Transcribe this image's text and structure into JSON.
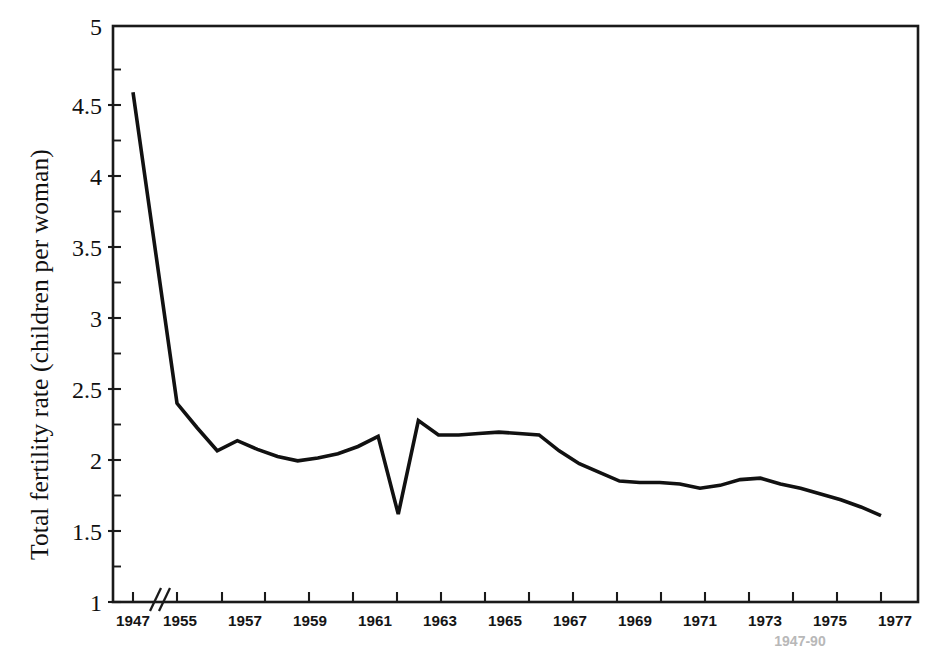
{
  "figure": {
    "name": "total-fertility-rate-line-chart",
    "background_color": "#ffffff",
    "line_color": "#111111",
    "axis_color": "#1a1a1a"
  },
  "axes": {
    "y_label": "Total fertility rate (children per woman)",
    "y_ticks": [
      "1",
      "1.5",
      "2",
      "2.5",
      "3",
      "3.5",
      "4",
      "4.5",
      "5"
    ],
    "y_min": 1,
    "y_max": 5,
    "y_major_step": 0.5,
    "y_minor_step": 0.25,
    "x_ticks": [
      "1947",
      "1955",
      "1957",
      "1959",
      "1961",
      "1963",
      "1965",
      "1967",
      "1969",
      "1971",
      "1973",
      "1975",
      "1977",
      "1979",
      "1981",
      "1983",
      "1985",
      "1987",
      "1989"
    ],
    "x_axis_break": "//",
    "x_axis_break_note": "axis break between 1947 and 1955"
  },
  "caption": {
    "partial_text": "1947-90"
  },
  "chart_data": {
    "type": "line",
    "title": "",
    "xlabel": "",
    "ylabel": "Total fertility rate (children per woman)",
    "ylim": [
      1,
      5
    ],
    "grid": false,
    "legend": false,
    "axis_break": {
      "between": [
        1947,
        1955
      ],
      "marker": "//"
    },
    "x": [
      1947,
      1955,
      1956,
      1957,
      1958,
      1959,
      1960,
      1961,
      1962,
      1963,
      1964,
      1965,
      1966,
      1967,
      1968,
      1969,
      1970,
      1971,
      1972,
      1973,
      1974,
      1975,
      1976,
      1977,
      1978,
      1979,
      1980,
      1981,
      1982,
      1983,
      1984,
      1985,
      1986,
      1987,
      1988,
      1989,
      1990
    ],
    "tick_labels_shown": [
      "1947",
      "1955",
      "1957",
      "1959",
      "1961",
      "1963",
      "1965",
      "1967",
      "1969",
      "1971",
      "1973",
      "1975",
      "1977",
      "1979",
      "1981",
      "1983",
      "1985",
      "1987",
      "1989"
    ],
    "values": [
      4.54,
      2.38,
      2.21,
      2.05,
      2.12,
      2.06,
      2.01,
      1.98,
      2.0,
      2.03,
      2.08,
      2.15,
      1.61,
      2.26,
      2.16,
      2.16,
      2.17,
      2.18,
      2.17,
      2.16,
      2.05,
      1.96,
      1.9,
      1.84,
      1.83,
      1.83,
      1.82,
      1.79,
      1.81,
      1.85,
      1.86,
      1.82,
      1.79,
      1.75,
      1.71,
      1.66,
      1.6
    ],
    "series": [
      {
        "name": "Total fertility rate",
        "values": [
          4.54,
          2.38,
          2.21,
          2.05,
          2.12,
          2.06,
          2.01,
          1.98,
          2.0,
          2.03,
          2.08,
          2.15,
          1.61,
          2.26,
          2.16,
          2.16,
          2.17,
          2.18,
          2.17,
          2.16,
          2.05,
          1.96,
          1.9,
          1.84,
          1.83,
          1.83,
          1.82,
          1.79,
          1.81,
          1.85,
          1.86,
          1.82,
          1.79,
          1.75,
          1.71,
          1.66,
          1.6
        ]
      }
    ],
    "annotations": [
      {
        "x": 1966,
        "y": 1.61,
        "note": "sharp one-year trough"
      },
      {
        "x": 1947,
        "y": 4.54,
        "note": "series maximum"
      }
    ]
  }
}
